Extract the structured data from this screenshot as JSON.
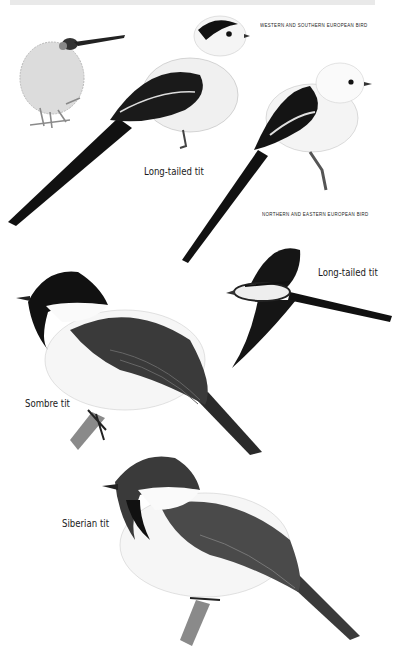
{
  "plate": {
    "captions": {
      "western": "WESTERN AND SOUTHERN EUROPEAN BIRD",
      "northern": "NORTHERN AND EASTERN EUROPEAN BIRD"
    },
    "labels": {
      "long_tailed_1": "Long-tailed tit",
      "long_tailed_2": "Long-tailed tit",
      "sombre": "Sombre tit",
      "siberian": "Siberian tit"
    },
    "illustrations": [
      {
        "id": "nest-with-long-tailed-tit",
        "description": "small long-tailed tit at a domed nest"
      },
      {
        "id": "long-tailed-tit-western",
        "description": "perched long-tailed tit with dark head stripe"
      },
      {
        "id": "long-tailed-tit-northern",
        "description": "perched white-headed long-tailed tit"
      },
      {
        "id": "long-tailed-tit-flight",
        "description": "long-tailed tit in flight"
      },
      {
        "id": "sombre-tit",
        "description": "perched sombre tit"
      },
      {
        "id": "siberian-tit",
        "description": "perched siberian tit"
      }
    ],
    "colors": {
      "ink": "#111111",
      "grey": "#555555",
      "light": "#e9e9e9"
    }
  }
}
